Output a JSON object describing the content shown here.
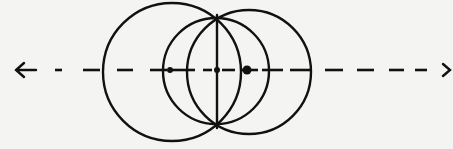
{
  "diagram": {
    "ink_color": "#111111",
    "background_color": "#f4f4f2",
    "axis": {
      "y": 70,
      "x_start": 15,
      "x_end": 450,
      "style": "dashed",
      "arrowheads": [
        "left",
        "right"
      ],
      "dashes": [
        [
          55,
          62
        ],
        [
          83,
          100
        ],
        [
          117,
          133
        ],
        [
          150,
          167
        ],
        [
          172,
          195
        ],
        [
          203,
          212
        ],
        [
          222,
          235
        ],
        [
          240,
          258
        ],
        [
          262,
          283
        ],
        [
          290,
          310
        ],
        [
          325,
          343
        ],
        [
          357,
          374
        ],
        [
          389,
          404
        ],
        [
          415,
          427
        ]
      ]
    },
    "circles": [
      {
        "name": "large-left-circle",
        "cx": 172,
        "cy": 72,
        "r": 69
      },
      {
        "name": "large-right-circle",
        "cx": 249,
        "cy": 72,
        "r": 62
      },
      {
        "name": "middle-circle",
        "cx": 216,
        "cy": 71,
        "r": 53
      }
    ],
    "chord": {
      "x": 217,
      "y1": 15,
      "y2": 128
    },
    "points": [
      {
        "name": "left-focus-point",
        "x": 170,
        "y": 70,
        "r": 3
      },
      {
        "name": "center-point",
        "x": 217,
        "y": 70,
        "r": 3
      },
      {
        "name": "right-focus-point",
        "x": 247,
        "y": 70,
        "r": 4.5
      }
    ]
  }
}
